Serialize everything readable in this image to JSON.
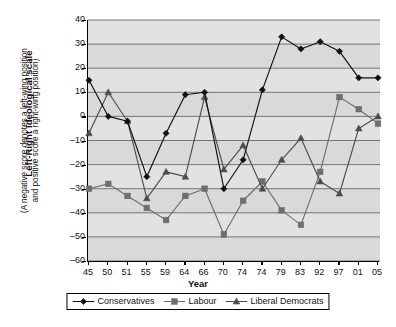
{
  "chart_data": {
    "type": "line",
    "title": "",
    "xlabel": "Year",
    "ylabel": "Left-Right Ideological scale",
    "ylabel_sub_line1": "(A negative score denotes a left-wing position",
    "ylabel_sub_line2": "and positive score a right-wing position)",
    "categories": [
      "45",
      "50",
      "51",
      "55",
      "59",
      "64",
      "66",
      "70",
      "74",
      "74",
      "79",
      "83",
      "92",
      "97",
      "01",
      "05"
    ],
    "ylim": [
      -60,
      40
    ],
    "yticks": [
      40,
      30,
      20,
      10,
      0,
      -10,
      -20,
      -30,
      -40,
      -50,
      -60
    ],
    "ytick_labels": [
      "40",
      "30",
      "20",
      "10",
      "0",
      "–10",
      "–20",
      "–30",
      "–40",
      "–50",
      "–60"
    ],
    "grid": "horizontal",
    "legend_position": "bottom",
    "series": [
      {
        "name": "Conservatives",
        "marker": "diamond",
        "color": "#111111",
        "values": [
          15,
          0,
          -2,
          -25,
          -7,
          9,
          10,
          -30,
          -18,
          11,
          33,
          28,
          31,
          27,
          16,
          16
        ]
      },
      {
        "name": "Labour",
        "marker": "square",
        "color": "#6e6e6e",
        "values": [
          -30,
          -28,
          -33,
          -38,
          -43,
          -33,
          -30,
          -49,
          -35,
          -27,
          -39,
          -45,
          -23,
          8,
          3,
          -3
        ]
      },
      {
        "name": "Liberal Democrats",
        "marker": "triangle",
        "color": "#4d4d4d",
        "values": [
          -7,
          10,
          -2,
          -34,
          -23,
          -25,
          8,
          -22,
          -12,
          -30,
          -18,
          -9,
          -27,
          -32,
          -5,
          0
        ]
      }
    ]
  },
  "legend": {
    "items": [
      {
        "label": "Conservatives",
        "marker": "diamond"
      },
      {
        "label": "Labour",
        "marker": "square"
      },
      {
        "label": "Liberal Democrats",
        "marker": "triangle"
      }
    ]
  }
}
